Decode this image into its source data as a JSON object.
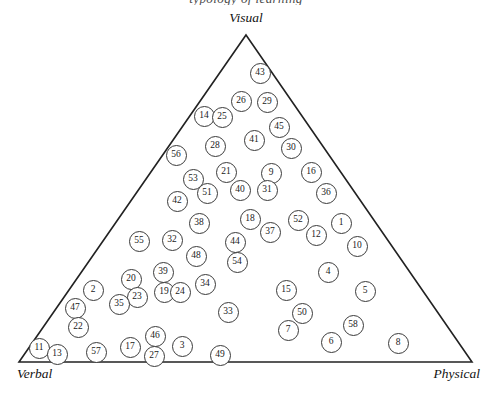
{
  "figure": {
    "title_partial": "typology of learning",
    "background_color": "#ffffff",
    "line_color": "#222222",
    "marker_fill": "#ffffff",
    "marker_stroke": "#3a3a3a"
  },
  "vertices": {
    "top": "Visual",
    "bottom_left": "Verbal",
    "bottom_right": "Physical"
  },
  "chart_data": {
    "type": "scatter",
    "title": "typology of learning",
    "xlabel": "",
    "ylabel": "",
    "grid": false,
    "legend": "none",
    "axis_labels": [
      "Visual",
      "Verbal",
      "Physical"
    ],
    "triangle": {
      "apex": [
        246,
        35
      ],
      "bottom_left": [
        19,
        362
      ],
      "bottom_right": [
        472,
        362
      ]
    },
    "point_count": 58,
    "points": [
      {
        "label": "43",
        "x": 260,
        "y": 73
      },
      {
        "label": "26",
        "x": 241,
        "y": 101
      },
      {
        "label": "29",
        "x": 267,
        "y": 102
      },
      {
        "label": "14",
        "x": 204,
        "y": 116
      },
      {
        "label": "25",
        "x": 222,
        "y": 117
      },
      {
        "label": "45",
        "x": 279,
        "y": 127
      },
      {
        "label": "41",
        "x": 254,
        "y": 140
      },
      {
        "label": "28",
        "x": 215,
        "y": 146
      },
      {
        "label": "30",
        "x": 291,
        "y": 148
      },
      {
        "label": "56",
        "x": 176,
        "y": 155
      },
      {
        "label": "21",
        "x": 226,
        "y": 172
      },
      {
        "label": "9",
        "x": 271,
        "y": 173
      },
      {
        "label": "16",
        "x": 311,
        "y": 172
      },
      {
        "label": "53",
        "x": 193,
        "y": 179
      },
      {
        "label": "51",
        "x": 207,
        "y": 193
      },
      {
        "label": "40",
        "x": 240,
        "y": 190
      },
      {
        "label": "31",
        "x": 267,
        "y": 190
      },
      {
        "label": "36",
        "x": 326,
        "y": 193
      },
      {
        "label": "42",
        "x": 177,
        "y": 201
      },
      {
        "label": "18",
        "x": 250,
        "y": 219
      },
      {
        "label": "52",
        "x": 298,
        "y": 220
      },
      {
        "label": "1",
        "x": 341,
        "y": 223
      },
      {
        "label": "38",
        "x": 199,
        "y": 223
      },
      {
        "label": "37",
        "x": 270,
        "y": 232
      },
      {
        "label": "12",
        "x": 316,
        "y": 235
      },
      {
        "label": "55",
        "x": 139,
        "y": 241
      },
      {
        "label": "32",
        "x": 172,
        "y": 240
      },
      {
        "label": "44",
        "x": 235,
        "y": 242
      },
      {
        "label": "10",
        "x": 357,
        "y": 246
      },
      {
        "label": "48",
        "x": 196,
        "y": 256
      },
      {
        "label": "54",
        "x": 237,
        "y": 262
      },
      {
        "label": "39",
        "x": 163,
        "y": 272
      },
      {
        "label": "4",
        "x": 328,
        "y": 272
      },
      {
        "label": "20",
        "x": 131,
        "y": 279
      },
      {
        "label": "34",
        "x": 205,
        "y": 284
      },
      {
        "label": "2",
        "x": 93,
        "y": 290
      },
      {
        "label": "19",
        "x": 164,
        "y": 292
      },
      {
        "label": "24",
        "x": 180,
        "y": 292
      },
      {
        "label": "15",
        "x": 286,
        "y": 290
      },
      {
        "label": "5",
        "x": 365,
        "y": 291
      },
      {
        "label": "23",
        "x": 137,
        "y": 297
      },
      {
        "label": "35",
        "x": 119,
        "y": 304
      },
      {
        "label": "47",
        "x": 75,
        "y": 308
      },
      {
        "label": "33",
        "x": 228,
        "y": 312
      },
      {
        "label": "50",
        "x": 302,
        "y": 313
      },
      {
        "label": "22",
        "x": 78,
        "y": 327
      },
      {
        "label": "7",
        "x": 288,
        "y": 330
      },
      {
        "label": "58",
        "x": 353,
        "y": 325
      },
      {
        "label": "46",
        "x": 155,
        "y": 336
      },
      {
        "label": "6",
        "x": 331,
        "y": 342
      },
      {
        "label": "17",
        "x": 130,
        "y": 347
      },
      {
        "label": "3",
        "x": 182,
        "y": 346
      },
      {
        "label": "11",
        "x": 39,
        "y": 348
      },
      {
        "label": "8",
        "x": 398,
        "y": 343
      },
      {
        "label": "57",
        "x": 96,
        "y": 352
      },
      {
        "label": "13",
        "x": 57,
        "y": 354
      },
      {
        "label": "27",
        "x": 154,
        "y": 356
      },
      {
        "label": "49",
        "x": 220,
        "y": 355
      }
    ]
  }
}
